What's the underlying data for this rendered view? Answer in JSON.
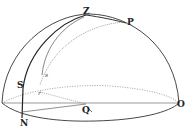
{
  "diagram": {
    "type": "celestial hemisphere",
    "labels": {
      "zenith": "Z",
      "pole": "P",
      "star": "S",
      "north": "N",
      "center": "Q",
      "horizon_point": "O",
      "small_s": "s",
      "small_r": "r"
    },
    "colors": {
      "line": "#333333",
      "dotted": "#777777",
      "background": "#ffffff"
    }
  }
}
